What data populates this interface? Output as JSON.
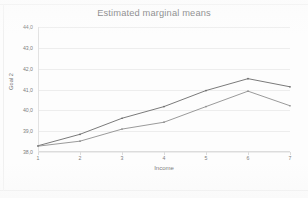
{
  "chart_data": {
    "type": "line",
    "title": "Estimated marginal means",
    "xlabel": "Income",
    "ylabel": "Goal 2",
    "x": [
      1,
      2,
      3,
      4,
      5,
      6,
      7
    ],
    "xticklabels": [
      "1",
      "2",
      "3",
      "4",
      "5",
      "6",
      "7"
    ],
    "yticklabels": [
      "44,0",
      "43,0",
      "42,0",
      "41,0",
      "40,0",
      "39,0",
      "38,0"
    ],
    "yticks": [
      44.0,
      43.0,
      42.0,
      41.0,
      40.0,
      39.0,
      38.0
    ],
    "ylim": [
      38.0,
      44.0
    ],
    "xlim": [
      1,
      7
    ],
    "grid": true,
    "legend_position": "lower-right",
    "legend_text": "",
    "series": [
      {
        "name": "series-1",
        "color": "#6b6b6b",
        "values": [
          38.3,
          38.85,
          39.62,
          40.18,
          40.95,
          41.52,
          41.13
        ]
      },
      {
        "name": "series-2",
        "color": "#8f8f8f",
        "values": [
          38.28,
          38.52,
          39.1,
          39.43,
          40.18,
          40.92,
          40.22
        ]
      }
    ]
  },
  "colors": {
    "grid": "#ededed",
    "axis": "#dcdcdc",
    "text": "#6f6f6f",
    "background": "#fdfdfd"
  }
}
